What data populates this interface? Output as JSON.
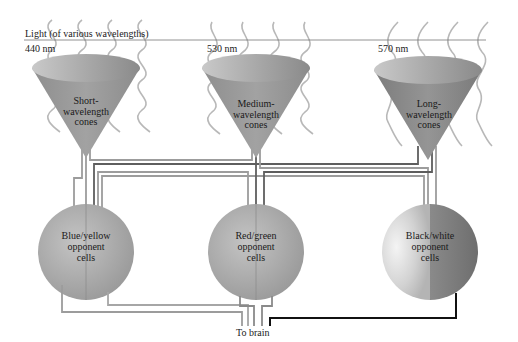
{
  "header": {
    "light_label": "Light (of various wavelengths)"
  },
  "wavelengths": [
    {
      "label": "440 nm"
    },
    {
      "label": "530 nm"
    },
    {
      "label": "570 nm"
    }
  ],
  "cones": [
    {
      "lines": [
        "Short-",
        "wavelength",
        "cones"
      ]
    },
    {
      "lines": [
        "Medium-",
        "wavelength",
        "cones"
      ]
    },
    {
      "lines": [
        "Long-",
        "wavelength",
        "cones"
      ]
    }
  ],
  "cells": [
    {
      "lines": [
        "Blue/yellow",
        "opponent",
        "cells"
      ]
    },
    {
      "lines": [
        "Red/green",
        "opponent",
        "cells"
      ]
    },
    {
      "lines": [
        "Black/white",
        "opponent",
        "cells"
      ]
    }
  ],
  "output": {
    "label": "To brain"
  },
  "colors": {
    "cone_fill": "#9a9a9a",
    "cell_fill": "#a8a8a8",
    "wire_light": "#9c9c9c",
    "wire_dark": "#5e5e5e",
    "wire_black": "#111111",
    "wave": "#b5b5b5"
  }
}
